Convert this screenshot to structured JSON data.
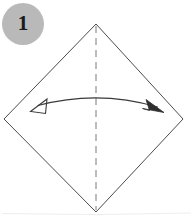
{
  "figure": {
    "kind": "origami-step-diagram",
    "caption_text": "",
    "background_color": "#ffffff"
  },
  "step_badge": {
    "label": "1",
    "shape": "circle",
    "fill_color": "#b9b9b9",
    "text_color": "#1a1a1a",
    "center_x": 23,
    "center_y": 24,
    "radius": 21
  },
  "paper": {
    "name": "square-paper-rotated-45",
    "outline_color": "#4c4c4c",
    "fill_color": "none",
    "vertices": [
      {
        "name": "top",
        "x": 96,
        "y": 24
      },
      {
        "name": "right",
        "x": 183,
        "y": 119
      },
      {
        "name": "bottom",
        "x": 96,
        "y": 212
      },
      {
        "name": "left",
        "x": 4,
        "y": 119
      }
    ]
  },
  "crease": {
    "name": "vertical-valley-fold-line",
    "style": "dashed",
    "color": "#7a7a7a",
    "dash_pattern": "7 5",
    "x1": 96,
    "y1": 26,
    "x2": 96,
    "y2": 210
  },
  "fold_arrow": {
    "name": "double-headed-fold-arrow",
    "color": "#3a3a3a",
    "arc": {
      "start_x": 38,
      "start_y": 106,
      "control_x": 98,
      "control_y": 90,
      "end_x": 158,
      "end_y": 107
    },
    "left_head": {
      "type": "open",
      "tip_x": 30,
      "tip_y": 111
    },
    "right_head": {
      "type": "filled",
      "tip_x": 164,
      "tip_y": 112
    }
  },
  "page_edge": {
    "name": "page-bottom-edge",
    "color": "#eeeeee",
    "y": 213
  }
}
